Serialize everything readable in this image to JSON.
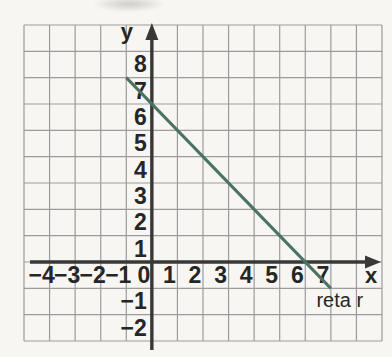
{
  "chart_data": {
    "type": "line",
    "title": "",
    "xlabel": "x",
    "ylabel": "y",
    "grid": {
      "show": true,
      "x_range": [
        -5,
        9
      ],
      "y_range": [
        -3,
        9
      ]
    },
    "x_ticks": {
      "values": [
        -4,
        -3,
        -2,
        -1,
        0,
        1,
        2,
        3,
        4,
        5,
        6,
        7
      ],
      "labels": [
        "−4",
        "−3",
        "−2",
        "−1",
        "0",
        "1",
        "2",
        "3",
        "4",
        "5",
        "6",
        "7"
      ]
    },
    "y_ticks": {
      "values": [
        -2,
        -1,
        1,
        2,
        3,
        4,
        5,
        6,
        7,
        8
      ],
      "labels": [
        "−2",
        "−1",
        "1",
        "2",
        "3",
        "4",
        "5",
        "6",
        "7",
        "8"
      ]
    },
    "series": [
      {
        "name": "reta r",
        "color": "#4b7365",
        "points": [
          [
            -1,
            7
          ],
          [
            7,
            -1
          ]
        ],
        "x_intercept": [
          6,
          0
        ],
        "y_intercept": [
          0,
          6
        ]
      }
    ],
    "annotations": [
      {
        "text": "reta r",
        "x": 7.35,
        "y": -1.45
      }
    ]
  },
  "colors": {
    "paper": "#f7f6f3",
    "grid": "#9c9c9c",
    "axis": "#383838",
    "text": "#262626"
  }
}
